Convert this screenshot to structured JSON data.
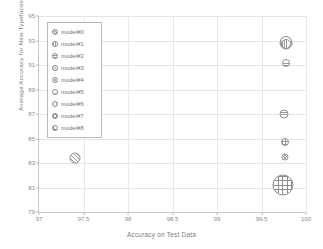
{
  "chart_data": {
    "type": "scatter",
    "title": "",
    "xlabel": "Accuracy on Test Data",
    "ylabel": "Average Accuracy for New Typefaces",
    "xlim": [
      97,
      100
    ],
    "ylim": [
      79,
      95
    ],
    "xticks": [
      "97",
      "97.5",
      "98",
      "98.5",
      "99",
      "99.5",
      "100"
    ],
    "xtick_values": [
      97,
      97.5,
      98,
      98.5,
      99,
      99.5,
      100
    ],
    "yticks": [
      "79",
      "81",
      "83",
      "85",
      "87",
      "89",
      "91",
      "93",
      "95"
    ],
    "ytick_values": [
      79,
      81,
      83,
      85,
      87,
      89,
      91,
      93,
      95
    ],
    "grid": true,
    "legend_position": "upper-left",
    "legend_entries": [
      "model#0",
      "model#1",
      "model#2",
      "model#3",
      "model#4",
      "model#5",
      "model#6",
      "model#7",
      "model#8"
    ],
    "points": [
      {
        "label": "model#0",
        "x": 99.78,
        "y": 92.8,
        "size": 13,
        "pattern": "h-dense"
      },
      {
        "label": "model#1",
        "x": 99.78,
        "y": 92.75,
        "size": 10,
        "pattern": "h-vert"
      },
      {
        "label": "model#2",
        "x": 99.77,
        "y": 91.2,
        "size": 8,
        "pattern": "h-horiz"
      },
      {
        "label": "model#3",
        "x": 97.4,
        "y": 83.4,
        "size": 11,
        "pattern": "h-diag"
      },
      {
        "label": "model#4",
        "x": 99.75,
        "y": 87.0,
        "size": 9,
        "pattern": "h-horiz"
      },
      {
        "label": "model#5",
        "x": 99.76,
        "y": 84.7,
        "size": 8,
        "pattern": "h-grid"
      },
      {
        "label": "model#6",
        "x": 99.76,
        "y": 83.45,
        "size": 7,
        "pattern": "h-cross"
      },
      {
        "label": "model#7",
        "x": 99.74,
        "y": 81.2,
        "size": 21,
        "pattern": "h-plus"
      },
      {
        "label": "model#8",
        "x": 99.78,
        "y": 92.85,
        "size": 12,
        "pattern": "h-light"
      }
    ],
    "legend_patterns": [
      "h-dense",
      "h-vert",
      "h-horiz",
      "h-diag",
      "h-cross",
      "h-light",
      "h-faint",
      "h-grid",
      "h-plus"
    ]
  }
}
